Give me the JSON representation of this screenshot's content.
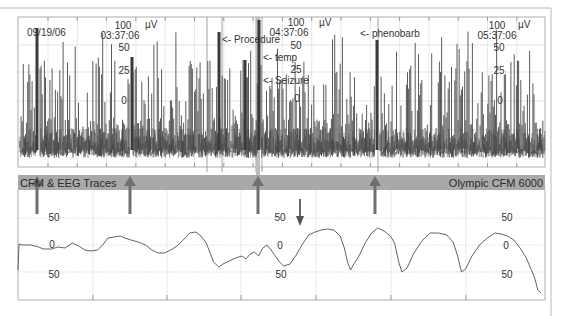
{
  "chart_data": [
    {
      "type": "line",
      "title": "Cerebral Function Monitor (aEEG) trace",
      "ylabel": "µV",
      "scale": "semi-log",
      "y_tick_labels": [
        "100",
        "50",
        "25",
        "10"
      ],
      "date": "09/19/06",
      "time_markers": [
        {
          "label": "03:37:06",
          "x_frac": 0.18
        },
        {
          "label": "04:37:06",
          "x_frac": 0.52
        },
        {
          "label": "05:37:06",
          "x_frac": 0.88
        }
      ],
      "annotations": [
        {
          "text": "<- Procedure",
          "x_frac": 0.385
        },
        {
          "text": "<- temp",
          "x_frac": 0.445
        },
        {
          "text": "<- Seizure",
          "x_frac": 0.445
        },
        {
          "text": "<- phenobarb",
          "x_frac": 0.645
        }
      ],
      "grid": true,
      "x_minutes_range": [
        0,
        180
      ]
    },
    {
      "type": "line",
      "title": "Raw EEG trace",
      "ylabel": "µV",
      "y_tick_labels": [
        "50",
        "0",
        "50"
      ],
      "ylim": [
        -50,
        50
      ],
      "pattern": "rhythmic seizure waveform (~5 cycles) after downward arrow",
      "grid": true
    }
  ],
  "upper_plot": {
    "date": "09/19/06",
    "blocks": [
      {
        "top": "100",
        "time": "03:37:06",
        "unit": "µV",
        "ticks": [
          "50",
          "25",
          "0"
        ]
      },
      {
        "top": "100",
        "time": "04:37:06",
        "unit": "µV",
        "ticks": [
          "50",
          "25",
          "0"
        ]
      },
      {
        "top": "100",
        "time": "05:37:06",
        "unit": "µV",
        "ticks": [
          "50",
          "25",
          "0"
        ]
      }
    ],
    "annotations": {
      "procedure": "<- Procedure",
      "temp": "<- temp",
      "seizure": "<- Seizure",
      "phenobarb": "<- phenobarb"
    }
  },
  "band": {
    "left_label": "CFM & EEG Traces",
    "right_label": "Olympic CFM 6000"
  },
  "lower_plot": {
    "left_ticks": [
      "50",
      "0",
      "50"
    ],
    "mid_ticks": [
      "50",
      "0",
      "50"
    ],
    "right_ticks": [
      "50",
      "0",
      "50"
    ]
  },
  "colors": {
    "trace": "#444444",
    "grid": "#d8d8d8",
    "band": "#a9a9a9",
    "arrow": "#6f6f6f",
    "frame": "#b0b0b0"
  }
}
